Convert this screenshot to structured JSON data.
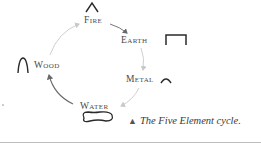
{
  "diagram": {
    "title": "Five Element cycle",
    "elements": [
      {
        "id": "fire",
        "label": "Fire",
        "symbol": "chevron-peak"
      },
      {
        "id": "earth",
        "label": "Earth",
        "symbol": "flat-bracket"
      },
      {
        "id": "metal",
        "label": "Metal",
        "symbol": "small-arch"
      },
      {
        "id": "water",
        "label": "Water",
        "symbol": "wavy-loop"
      },
      {
        "id": "wood",
        "label": "Wood",
        "symbol": "tall-arch"
      }
    ],
    "cycle_order": [
      "Fire",
      "Earth",
      "Metal",
      "Water",
      "Wood"
    ],
    "arrow_color": "#c8c8c8",
    "arrow_dark_color": "#6a6a6a"
  },
  "caption": {
    "marker": "▲",
    "text": "The Five Element cycle."
  }
}
